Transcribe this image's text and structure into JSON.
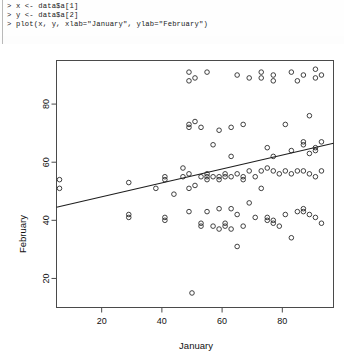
{
  "console": {
    "name": "r-console",
    "lines": [
      "> x <- data$a[1]",
      "> y <- data$a[2]",
      "> plot(x, y, xlab=\"January\", ylab=\"February\")"
    ],
    "prompt": ">"
  },
  "chart_data": {
    "type": "scatter",
    "title": "",
    "xlabel": "January",
    "ylabel": "February",
    "xlim": [
      5,
      97
    ],
    "ylim": [
      10,
      95
    ],
    "xticks": [
      20,
      40,
      60,
      80
    ],
    "yticks": [
      20,
      40,
      60,
      80
    ],
    "grid": false,
    "legend": null,
    "point_symbol": "open-circle",
    "trendline": {
      "type": "linear",
      "x": [
        5,
        97
      ],
      "y": [
        44.5,
        66.5
      ],
      "visible": true
    },
    "points": [
      [
        6,
        54
      ],
      [
        6,
        51
      ],
      [
        29,
        53
      ],
      [
        29,
        42
      ],
      [
        29,
        41
      ],
      [
        38,
        51
      ],
      [
        41,
        55
      ],
      [
        41,
        54
      ],
      [
        41,
        41
      ],
      [
        41,
        40
      ],
      [
        44,
        49
      ],
      [
        47,
        58
      ],
      [
        47,
        55
      ],
      [
        49,
        91
      ],
      [
        49,
        88
      ],
      [
        49,
        73
      ],
      [
        49,
        72
      ],
      [
        49,
        56
      ],
      [
        49,
        51
      ],
      [
        49,
        43
      ],
      [
        50,
        15
      ],
      [
        51,
        89
      ],
      [
        51,
        74
      ],
      [
        51,
        52
      ],
      [
        53,
        72
      ],
      [
        53,
        55
      ],
      [
        53,
        39
      ],
      [
        53,
        38
      ],
      [
        55,
        91
      ],
      [
        55,
        56
      ],
      [
        55,
        55
      ],
      [
        55,
        54
      ],
      [
        55,
        43
      ],
      [
        57,
        66
      ],
      [
        57,
        55
      ],
      [
        57,
        38
      ],
      [
        59,
        71
      ],
      [
        59,
        55
      ],
      [
        59,
        54
      ],
      [
        59,
        44
      ],
      [
        59,
        37
      ],
      [
        61,
        56
      ],
      [
        61,
        55
      ],
      [
        61,
        39
      ],
      [
        61,
        38
      ],
      [
        63,
        72
      ],
      [
        63,
        62
      ],
      [
        63,
        55
      ],
      [
        63,
        44
      ],
      [
        63,
        37
      ],
      [
        65,
        90
      ],
      [
        65,
        56
      ],
      [
        65,
        42
      ],
      [
        65,
        31
      ],
      [
        67,
        73
      ],
      [
        67,
        55
      ],
      [
        67,
        54
      ],
      [
        67,
        38
      ],
      [
        69,
        89
      ],
      [
        69,
        57
      ],
      [
        69,
        46
      ],
      [
        71,
        55
      ],
      [
        71,
        41
      ],
      [
        73,
        91
      ],
      [
        73,
        89
      ],
      [
        73,
        57
      ],
      [
        73,
        51
      ],
      [
        75,
        65
      ],
      [
        75,
        58
      ],
      [
        75,
        41
      ],
      [
        75,
        40
      ],
      [
        77,
        90
      ],
      [
        77,
        88
      ],
      [
        77,
        62
      ],
      [
        77,
        57
      ],
      [
        77,
        40
      ],
      [
        77,
        39
      ],
      [
        79,
        56
      ],
      [
        79,
        38
      ],
      [
        81,
        73
      ],
      [
        81,
        57
      ],
      [
        81,
        42
      ],
      [
        83,
        91
      ],
      [
        83,
        64
      ],
      [
        83,
        56
      ],
      [
        83,
        34
      ],
      [
        85,
        88
      ],
      [
        85,
        57
      ],
      [
        85,
        43
      ],
      [
        87,
        90
      ],
      [
        87,
        67
      ],
      [
        87,
        66
      ],
      [
        87,
        57
      ],
      [
        87,
        44
      ],
      [
        87,
        43
      ],
      [
        89,
        76
      ],
      [
        89,
        63
      ],
      [
        89,
        56
      ],
      [
        89,
        42
      ],
      [
        91,
        92
      ],
      [
        91,
        89
      ],
      [
        91,
        65
      ],
      [
        91,
        64
      ],
      [
        91,
        55
      ],
      [
        91,
        41
      ],
      [
        93,
        90
      ],
      [
        93,
        67
      ],
      [
        93,
        57
      ],
      [
        93,
        39
      ]
    ]
  },
  "colors": {
    "point_stroke": "#2b2b2b",
    "line": "#1e1e1e",
    "frame": "#4a4a4a",
    "text": "#111111",
    "background": "#ffffff"
  }
}
